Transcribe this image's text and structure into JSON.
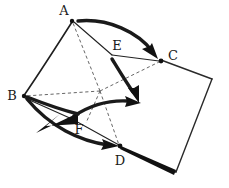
{
  "figure": {
    "background_color": "#ffffff",
    "ink_color": "#1a1a1a",
    "dashed_color": "#555555",
    "width": 229,
    "height": 188
  },
  "vertices": [
    {
      "id": "A",
      "label": "A",
      "x": 72,
      "y": 20,
      "label_x": 63,
      "label_y": 10,
      "has_dot": true
    },
    {
      "id": "B",
      "label": "B",
      "x": 23,
      "y": 96,
      "label_x": 13,
      "label_y": 96,
      "has_dot": true
    },
    {
      "id": "C",
      "label": "C",
      "x": 161,
      "y": 60,
      "label_x": 173,
      "label_y": 56,
      "has_dot": true
    },
    {
      "id": "D",
      "label": "D",
      "x": 120,
      "y": 146,
      "label_x": 120,
      "label_y": 160,
      "has_dot": true
    },
    {
      "id": "E",
      "label": "E",
      "x": 118,
      "y": 46,
      "label_x": 118,
      "label_y": 46,
      "has_dot": false
    },
    {
      "id": "F",
      "label": "F",
      "x": 79,
      "y": 129,
      "label_x": 79,
      "label_y": 129,
      "has_dot": false
    }
  ],
  "center_point": {
    "x": 100,
    "y": 91
  },
  "dashed_edges": [
    {
      "from": "center",
      "to": "A"
    },
    {
      "from": "center",
      "to": "B"
    },
    {
      "from": "center",
      "to": "C"
    },
    {
      "from": "center",
      "to": "D"
    },
    {
      "from": "B",
      "to": "center"
    }
  ],
  "solid_edges": [
    {
      "from": "A",
      "to": "E",
      "style": "thin"
    },
    {
      "from": "E",
      "to": "C",
      "style": "thin"
    },
    {
      "from": "F",
      "to": "D",
      "style": "thin"
    },
    {
      "from": "B",
      "to": "F",
      "style": "thin"
    }
  ],
  "curved_edges": [
    {
      "from": "A",
      "to": "B",
      "style": "solid-curve",
      "bulge": "left"
    }
  ],
  "thick_arrows": [
    {
      "id": "arrow-a-to-c",
      "from": "A",
      "to": "C",
      "curve": "over"
    },
    {
      "id": "arrow-e-down",
      "from": "E",
      "to": "center-right",
      "curve": "down"
    },
    {
      "id": "arrow-center-right",
      "from": "F-region",
      "to": "right",
      "curve": "up"
    },
    {
      "id": "arrow-b-to-d",
      "from": "B",
      "to": "D",
      "curve": "down"
    },
    {
      "id": "arrow-f-to-b",
      "from": "F",
      "to": "B",
      "curve": "wedge"
    },
    {
      "id": "wedge-d-corner",
      "from": "D",
      "to": "bottom-right-corner",
      "curve": "wedge"
    }
  ],
  "outline_polygon": {
    "description": "quadrilateral face from C to right edge down to bottom",
    "points": "161,60 212,79 176,172 120,146"
  }
}
